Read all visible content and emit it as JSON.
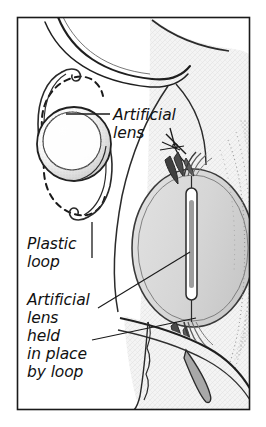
{
  "figure": {
    "style": "black-and-white medical line illustration with stipple shading",
    "frame": {
      "border_color": "#1a1a1a",
      "background": "#ffffff"
    }
  },
  "labels": [
    {
      "id": "artificial-lens",
      "lines": [
        "Artificial",
        "lens"
      ],
      "line1": "Artificial",
      "line2": "lens",
      "leader": "horizontal line pointing left to inset lens optic"
    },
    {
      "id": "plastic-loop",
      "lines": [
        "Plastic",
        "loop"
      ],
      "line1": "Plastic",
      "line2": "loop",
      "leader": "vertical line pointing up to inset haptic loop"
    },
    {
      "id": "artificial-lens-held",
      "lines": [
        "Artificial",
        "lens",
        "held",
        "in place",
        "by loop"
      ],
      "line1": "Artificial",
      "line2": "lens",
      "line3": "held",
      "line4": "in place",
      "line5": "by loop",
      "leader": "two diagonal lines pointing up-right to implanted lens and loop"
    }
  ],
  "anatomy": {
    "inset": {
      "name": "isolated artificial lens",
      "parts": [
        "optic",
        "upper plastic loop",
        "lower plastic loop",
        "dashed flexed loop outlines"
      ]
    },
    "eye": {
      "name": "eye cross-section",
      "parts": [
        "cornea",
        "sclera",
        "iris",
        "capsular bag",
        "vitreous body",
        "implanted lens optic",
        "haptic loops",
        "suture at incision"
      ]
    }
  },
  "colors": {
    "ink": "#1a1a1a",
    "line": "#2a2a2a",
    "vitreous_fill": "#d8d8d8",
    "sclera_fill": "#f2f2f2",
    "stipple": "#7a7a7a",
    "loop_fill": "#9a9a9a",
    "paper": "#ffffff"
  }
}
